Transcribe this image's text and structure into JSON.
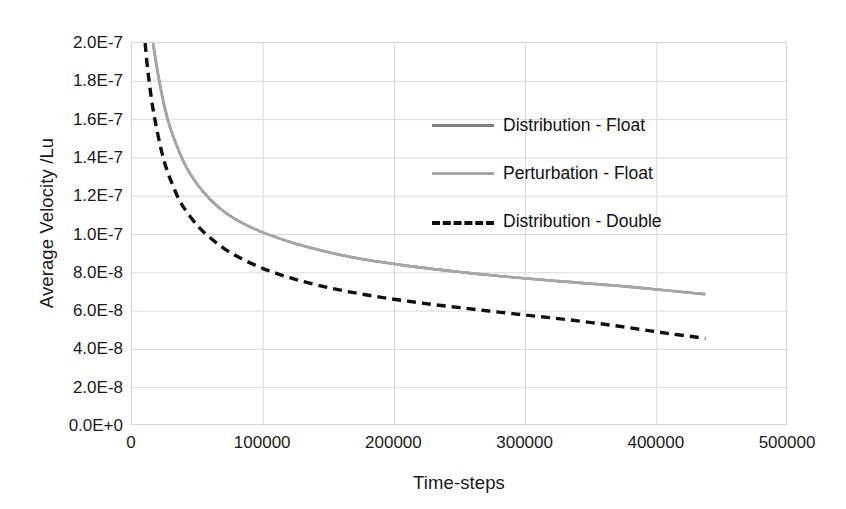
{
  "chart_data": {
    "type": "line",
    "title": "",
    "xlabel": "Time-steps",
    "ylabel": "Average Velocity /Lu",
    "xlim": [
      0,
      500000
    ],
    "ylim": [
      0,
      2e-07
    ],
    "grid": true,
    "legend_position": "inside-top-right",
    "x_ticks": [
      0,
      100000,
      200000,
      300000,
      400000,
      500000
    ],
    "x_tick_labels": [
      "0",
      "100000",
      "200000",
      "300000",
      "400000",
      "500000"
    ],
    "y_ticks": [
      0,
      2e-08,
      4e-08,
      6e-08,
      8e-08,
      1e-07,
      1.2e-07,
      1.4e-07,
      1.6e-07,
      1.8e-07,
      2e-07
    ],
    "y_tick_labels": [
      "0.0E+0",
      "2.0E-8",
      "4.0E-8",
      "6.0E-8",
      "8.0E-8",
      "1.0E-7",
      "1.2E-7",
      "1.4E-7",
      "1.6E-7",
      "1.8E-7",
      "2.0E-7"
    ],
    "series": [
      {
        "name": "Distribution - Float",
        "color": "#808080",
        "style": "solid",
        "x": [
          16000,
          20000,
          25000,
          30000,
          40000,
          50000,
          60000,
          70000,
          80000,
          90000,
          100000,
          110000,
          120000,
          130000,
          150000,
          170000,
          190000,
          210000,
          230000,
          250000,
          270000,
          290000,
          310000,
          330000,
          350000,
          370000,
          390000,
          410000,
          437000
        ],
        "y": [
          2e-07,
          1.83e-07,
          1.66e-07,
          1.54e-07,
          1.37e-07,
          1.26e-07,
          1.18e-07,
          1.12e-07,
          1.075e-07,
          1.04e-07,
          1.01e-07,
          9.85e-08,
          9.62e-08,
          9.42e-08,
          9.07e-08,
          8.79e-08,
          8.56e-08,
          8.36e-08,
          8.19e-08,
          8.04e-08,
          7.9e-08,
          7.77e-08,
          7.65e-08,
          7.54e-08,
          7.43e-08,
          7.32e-08,
          7.2e-08,
          7.06e-08,
          6.88e-08
        ]
      },
      {
        "name": "Perturbation - Float",
        "color": "#a6a6a6",
        "style": "solid",
        "x": [
          16000,
          20000,
          25000,
          30000,
          40000,
          50000,
          60000,
          70000,
          80000,
          90000,
          100000,
          110000,
          120000,
          130000,
          150000,
          170000,
          190000,
          210000,
          230000,
          250000,
          270000,
          290000,
          310000,
          330000,
          350000,
          370000,
          390000,
          410000,
          437000
        ],
        "y": [
          2e-07,
          1.83e-07,
          1.66e-07,
          1.54e-07,
          1.37e-07,
          1.26e-07,
          1.18e-07,
          1.12e-07,
          1.075e-07,
          1.04e-07,
          1.01e-07,
          9.85e-08,
          9.62e-08,
          9.42e-08,
          9.07e-08,
          8.79e-08,
          8.56e-08,
          8.36e-08,
          8.19e-08,
          8.04e-08,
          7.9e-08,
          7.77e-08,
          7.65e-08,
          7.54e-08,
          7.43e-08,
          7.32e-08,
          7.2e-08,
          7.06e-08,
          6.88e-08
        ]
      },
      {
        "name": "Distribution - Double",
        "color": "#101010",
        "style": "dashed",
        "x": [
          10000,
          12000,
          15000,
          18000,
          22000,
          26000,
          30000,
          35000,
          40000,
          50000,
          60000,
          70000,
          80000,
          90000,
          100000,
          110000,
          120000,
          130000,
          150000,
          170000,
          190000,
          210000,
          230000,
          250000,
          270000,
          290000,
          310000,
          330000,
          350000,
          370000,
          390000,
          410000,
          437000
        ],
        "y": [
          2e-07,
          1.86e-07,
          1.7e-07,
          1.58e-07,
          1.45e-07,
          1.35e-07,
          1.275e-07,
          1.195e-07,
          1.135e-07,
          1.045e-07,
          9.8e-08,
          9.28e-08,
          8.86e-08,
          8.52e-08,
          8.22e-08,
          7.97e-08,
          7.75e-08,
          7.55e-08,
          7.22e-08,
          6.95e-08,
          6.72e-08,
          6.52e-08,
          6.34e-08,
          6.18e-08,
          6.02e-08,
          5.87e-08,
          5.72e-08,
          5.57e-08,
          5.4e-08,
          5.22e-08,
          5.02e-08,
          4.82e-08,
          4.58e-08
        ]
      }
    ]
  },
  "legend": {
    "items": [
      {
        "label": "Distribution - Float",
        "color": "#808080",
        "style": "solid"
      },
      {
        "label": "Perturbation - Float",
        "color": "#a6a6a6",
        "style": "solid"
      },
      {
        "label": "Distribution - Double",
        "color": "#101010",
        "style": "dashed"
      }
    ]
  },
  "colors": {
    "background": "#ffffff",
    "gridline": "#d9d9d9",
    "axis_frame": "#d4d4d4",
    "text": "#1a1a1a"
  }
}
